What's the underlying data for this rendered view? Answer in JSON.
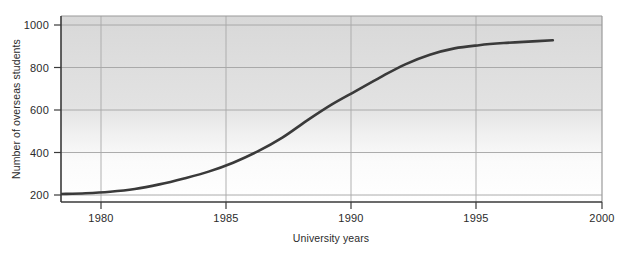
{
  "chart_data": {
    "type": "line",
    "title": "",
    "xlabel": "University years",
    "ylabel": "Number of overseas students",
    "xlim": [
      1978,
      2000
    ],
    "ylim": [
      160,
      1040
    ],
    "xticks": [
      1980,
      1985,
      1990,
      1995,
      2000
    ],
    "yticks": [
      200,
      400,
      600,
      800,
      1000
    ],
    "xtick_labels": [
      "1980",
      "1985",
      "1990",
      "1995",
      "2000"
    ],
    "ytick_labels": [
      "200",
      "400",
      "600",
      "800",
      "1000"
    ],
    "grid": "horizontal-and-vertical",
    "legend": "none",
    "series": [
      {
        "name": "Overseas students",
        "color": "#3a3a3a",
        "x": [
          1978,
          1979,
          1980,
          1981,
          1982,
          1983,
          1984,
          1985,
          1986,
          1987,
          1988,
          1989,
          1990,
          1991,
          1992,
          1993,
          1994,
          1995,
          1996,
          1997,
          1998
        ],
        "values": [
          205,
          208,
          215,
          228,
          250,
          278,
          310,
          352,
          405,
          470,
          550,
          625,
          690,
          755,
          815,
          860,
          890,
          905,
          915,
          922,
          928
        ]
      }
    ],
    "annotations": []
  },
  "axes": {
    "y_axis_title": "Number of overseas students",
    "x_axis_title": "University years",
    "plot_background_top_color": "#dcdcdc",
    "plot_background_bottom_color": "#ffffff",
    "gridline_color": "#a8a8a8",
    "axis_line_color": "#3a3a3a",
    "line_color": "#3a3a3a"
  }
}
